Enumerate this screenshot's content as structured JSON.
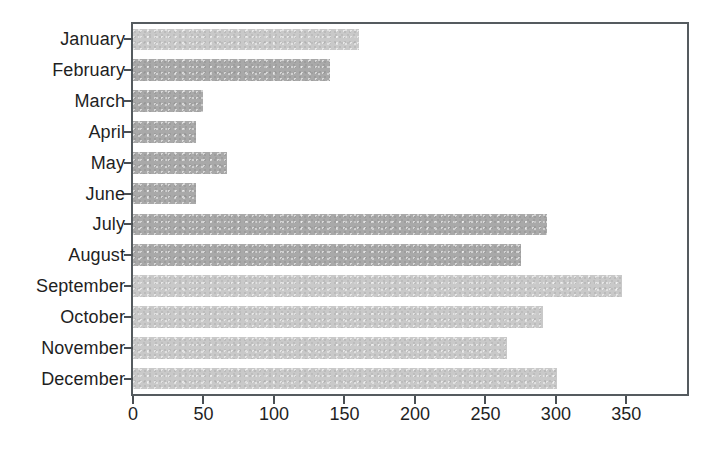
{
  "chart_data": {
    "type": "bar",
    "orientation": "horizontal",
    "title": "",
    "subtitle": "",
    "xlabel": "",
    "ylabel": "",
    "categories": [
      "January",
      "February",
      "March",
      "April",
      "May",
      "June",
      "July",
      "August",
      "September",
      "October",
      "November",
      "December"
    ],
    "values": [
      160,
      140,
      50,
      45,
      67,
      45,
      294,
      275,
      347,
      291,
      265,
      301
    ],
    "series": [
      {
        "name": "Monthly value",
        "values": [
          160,
          140,
          50,
          45,
          67,
          45,
          294,
          275,
          347,
          291,
          265,
          301
        ]
      }
    ],
    "xlim": [
      0,
      393
    ],
    "xticks": [
      0,
      50,
      100,
      150,
      200,
      250,
      300,
      350
    ],
    "xticklabels": [
      "0",
      "50",
      "100",
      "150",
      "200",
      "250",
      "300",
      "350"
    ],
    "yticks": [
      "January",
      "February",
      "March",
      "April",
      "May",
      "June",
      "July",
      "August",
      "September",
      "October",
      "November",
      "December"
    ],
    "grid": false,
    "legend": "none",
    "bar_colors": [
      "#c9c9c9",
      "#a9a9a9",
      "#a9a9a9",
      "#a9a9a9",
      "#a9a9a9",
      "#a9a9a9",
      "#a9a9a9",
      "#a9a9a9",
      "#c9c9c9",
      "#c9c9c9",
      "#c9c9c9",
      "#c9c9c9"
    ],
    "bar_tones": [
      "light",
      "dark",
      "dark",
      "dark",
      "dark",
      "dark",
      "dark",
      "dark",
      "light",
      "light",
      "light",
      "light"
    ],
    "frame_color": "#555b5f",
    "background_color": "#ffffff"
  }
}
